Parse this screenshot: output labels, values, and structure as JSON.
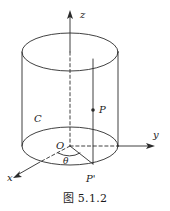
{
  "figure": {
    "caption": "图 5.1.2",
    "stroke_color": "#2b2b2b",
    "background_color": "#ffffff",
    "axes": [
      {
        "name": "z",
        "label": "z",
        "label_x": 80,
        "label_y": 18
      },
      {
        "name": "y",
        "label": "y",
        "label_x": 153,
        "label_y": 138
      },
      {
        "name": "x",
        "label": "x",
        "label_x": 9,
        "label_y": 180
      }
    ],
    "labels": [
      {
        "name": "origin",
        "text": "O",
        "x": 57,
        "y": 149
      },
      {
        "name": "point-p",
        "text": "P",
        "x": 99,
        "y": 112
      },
      {
        "name": "point-p-prime",
        "text": "P'",
        "x": 88,
        "y": 182
      },
      {
        "name": "curve-c",
        "text": "C",
        "x": 36,
        "y": 122
      },
      {
        "name": "angle-theta",
        "text": "θ",
        "x": 63,
        "y": 162
      }
    ],
    "geometry": {
      "top_ellipse": {
        "cx": 70,
        "cy": 52,
        "rx": 48,
        "ry": 19
      },
      "bottom_ellipse": {
        "cx": 70,
        "cy": 146,
        "rx": 48,
        "ry": 19
      },
      "left_wall_x": 22,
      "right_wall_x": 118,
      "generator_x": 93,
      "point_p": {
        "x": 93,
        "y": 110
      },
      "point_p_prime": {
        "x": 93,
        "y": 164
      }
    }
  }
}
